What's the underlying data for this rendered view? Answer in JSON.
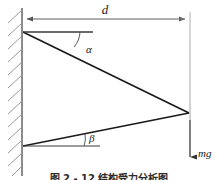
{
  "figure": {
    "type": "physics-free-body-diagram",
    "background_color": "#ffffff",
    "width": 218,
    "height": 180,
    "labels": {
      "distance": "d",
      "angle_upper": "α",
      "angle_lower": "β",
      "weight": "mg"
    },
    "caption": "图 2 - 12  结构受力分析图",
    "colors": {
      "line": "#1a1a1a",
      "thin_line": "#8a8a8a",
      "hatch": "#8a8a8a",
      "text": "#1a1a1a"
    },
    "elements": [
      {
        "name": "wall",
        "description": "vertical hatched support wall at left"
      },
      {
        "name": "dimension-line-d",
        "description": "horizontal double arrow labelled d spanning wall to load point"
      },
      {
        "name": "upper-member",
        "description": "line from upper wall anchor down to right vertex"
      },
      {
        "name": "lower-member",
        "description": "line from lower wall anchor up to right vertex"
      },
      {
        "name": "upper-reference-line",
        "description": "horizontal dashed-style reference at upper anchor"
      },
      {
        "name": "lower-reference-line",
        "description": "horizontal reference at lower anchor"
      },
      {
        "name": "weight-arrow",
        "description": "downward arrow at right vertex labelled mg"
      }
    ],
    "geometry": {
      "wall_x": 22,
      "wall_top": 8,
      "wall_bottom": 176,
      "upper_anchor_y": 32,
      "lower_anchor_y": 146,
      "vertex_x": 189,
      "vertex_y": 113,
      "dimension_y": 19,
      "weight_arrow_bottom": 163
    }
  }
}
